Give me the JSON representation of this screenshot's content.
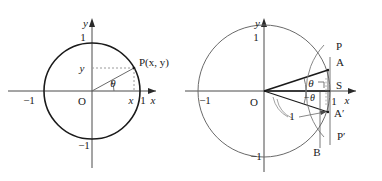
{
  "figure": {
    "background_color": "#ffffff",
    "stroke_color": "#1a1a1a",
    "thin_stroke_color": "#555555",
    "dashed_color": "#8a8a8a"
  },
  "left_diagram": {
    "name": "unit-circle-point-P",
    "axis_labels": {
      "x": "x",
      "y": "y"
    },
    "ticks": {
      "x_right": "1",
      "x_left": "−1",
      "y_top": "1",
      "y_bottom": "−1"
    },
    "origin_label": "O",
    "point_label": "P(x, y)",
    "angle_label": "θ",
    "coord_x_label": "x",
    "coord_y_label": "y",
    "geometry": {
      "center": [
        92,
        91
      ],
      "radius": 48,
      "theta_degrees": 28,
      "point_on_circle": [
        134,
        68
      ]
    }
  },
  "right_diagram": {
    "name": "unit-circle-tangent-construction",
    "axis_labels": {
      "x": "x",
      "y": "y"
    },
    "ticks": {
      "x_right": "1",
      "x_left": "−1",
      "y_top": "1",
      "y_bottom": "−1"
    },
    "origin_label": "O",
    "angle_label_upper": "θ",
    "angle_label_lower": "−θ",
    "radius_label": "1",
    "points": [
      {
        "label": "P",
        "name": "point-P"
      },
      {
        "label": "A",
        "name": "point-A"
      },
      {
        "label": "S",
        "name": "point-S"
      },
      {
        "label": "A′",
        "name": "point-A-prime"
      },
      {
        "label": "P′",
        "name": "point-P-prime"
      },
      {
        "label": "B",
        "name": "point-B"
      }
    ],
    "right_angle_marker": true,
    "geometry": {
      "center": [
        264,
        91
      ],
      "radius": 66,
      "theta_degrees": 18,
      "tangent_x": 330
    }
  }
}
